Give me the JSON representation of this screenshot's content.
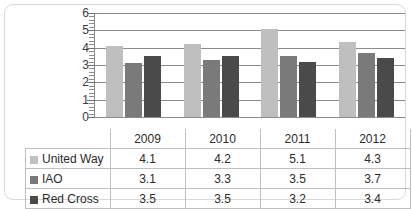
{
  "chart_data": {
    "type": "bar",
    "title": "",
    "xlabel": "",
    "ylabel": "",
    "categories": [
      "2009",
      "2010",
      "2011",
      "2012"
    ],
    "series": [
      {
        "name": "United Way",
        "values": [
          4.1,
          4.2,
          5.1,
          4.3
        ],
        "color": "#bfbfbf"
      },
      {
        "name": "IAO",
        "values": [
          3.1,
          3.3,
          3.5,
          3.7
        ],
        "color": "#7a7a7a"
      },
      {
        "name": "Red Cross",
        "values": [
          3.5,
          3.5,
          3.2,
          3.4
        ],
        "color": "#4a4a4a"
      }
    ],
    "ylim": [
      0,
      6
    ],
    "ytick_labels": [
      "6",
      "5",
      "4",
      "3",
      "2",
      "1",
      "0"
    ],
    "grid": true,
    "legend_position": "table-left",
    "minor_ticks_per_unit": 5
  },
  "table": {
    "year_row": [
      "2009",
      "2010",
      "2011",
      "2012"
    ],
    "rows": [
      {
        "label": "United Way",
        "values": [
          "4.1",
          "4.2",
          "5.1",
          "4.3"
        ]
      },
      {
        "label": "IAO",
        "values": [
          "3.1",
          "3.3",
          "3.5",
          "3.7"
        ]
      },
      {
        "label": "Red Cross",
        "values": [
          "3.5",
          "3.5",
          "3.2",
          "3.4"
        ]
      }
    ]
  }
}
